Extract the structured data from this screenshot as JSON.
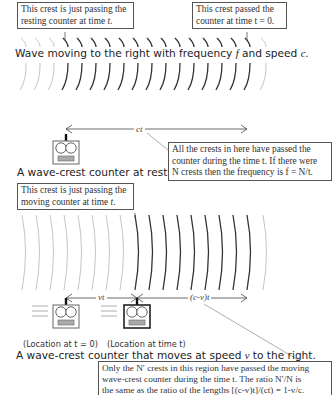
{
  "top_panel": {
    "callout_left": {
      "line1": "This crest is just passing the",
      "line2_prefix": "resting counter at time ",
      "line2_var": "t",
      "line2_suffix": "."
    },
    "callout_right": {
      "line1": "This crest passed the",
      "line2": "counter at time t = 0."
    },
    "wave_caption": {
      "prefix": "Wave moving to the right with frequency ",
      "f": "f",
      "mid": " and speed ",
      "c": "c",
      "suffix": "."
    },
    "dimension_label": "ct",
    "counter_caption": "A wave-crest counter at rest.",
    "callout_explain": {
      "line1": "All the crests in here have passed the",
      "line2": "counter during the time t. If there were",
      "line3": "N crests then the frequency is f = N/t."
    },
    "crests": {
      "light_before": [
        24,
        38,
        52
      ],
      "dark": [
        66,
        80,
        94,
        108,
        122,
        136,
        150,
        164,
        178,
        192,
        206,
        220,
        234,
        248
      ],
      "light_after": [
        264
      ]
    }
  },
  "bottom_panel": {
    "callout_left": {
      "line1": "This crest is just passing the",
      "line2_prefix": "moving counter at time ",
      "line2_var": "t",
      "line2_suffix": "."
    },
    "dimension_left_label": "vt",
    "dimension_right_label": "(c-v)t",
    "location_start": "(Location at t = 0)",
    "location_end": "(Location at time t)",
    "counter_caption": {
      "prefix": "A wave-crest counter that moves at speed ",
      "v": "v",
      "suffix": " to the right."
    },
    "callout_explain": {
      "line1": "Only the N′ crests in this region have passed the moving",
      "line2": "wave-crest counter during the time t. The ratio N′/N is",
      "line3": "the same as the ratio of the lengths [(c-v)t]/(ct) = 1-v/c."
    },
    "crests": {
      "light_before": [
        24,
        38,
        52,
        66,
        80,
        94,
        108,
        122
      ],
      "dark": [
        137,
        151,
        165,
        179,
        193,
        207,
        221,
        235,
        249
      ],
      "light_after": [
        265
      ]
    }
  },
  "colors": {
    "dark_crest": "#333333",
    "light_crest": "#b5b5b5",
    "border": "#555555"
  }
}
